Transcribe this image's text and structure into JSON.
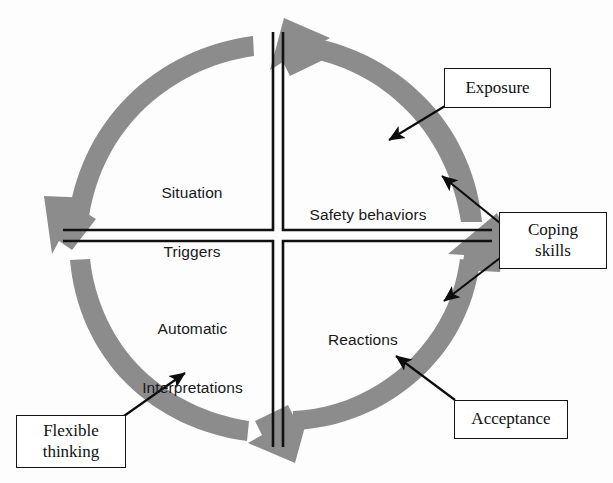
{
  "diagram": {
    "colors": {
      "ring_gray": "#8c8c8c",
      "line_black": "#111111",
      "box_border": "#141414",
      "box_fill": "#ffffff",
      "text_dark": "#18181a",
      "background": "#fdfdfd"
    },
    "quadrants": [
      {
        "id": "situation-triggers",
        "position": "top-left",
        "label_line1": "Situation",
        "label_line2": "Triggers"
      },
      {
        "id": "safety-behaviors",
        "position": "top-right",
        "label_line1": "Safety behaviors",
        "label_line2": ""
      },
      {
        "id": "automatic-interpretations",
        "position": "bottom-left",
        "label_line1": "Automatic",
        "label_line2": "Interpretations"
      },
      {
        "id": "reactions",
        "position": "bottom-right",
        "label_line1": "Reactions",
        "label_line2": ""
      }
    ],
    "callouts": [
      {
        "id": "exposure",
        "line1": "Exposure",
        "line2": "",
        "points_to": "safety-behaviors-arc"
      },
      {
        "id": "coping-skills",
        "line1": "Coping",
        "line2": "skills",
        "points_to": "safety-behaviors-label-and-reactions"
      },
      {
        "id": "acceptance",
        "line1": "Acceptance",
        "line2": "",
        "points_to": "reactions-arc"
      },
      {
        "id": "flexible-thinking",
        "line1": "Flexible",
        "line2": "thinking",
        "points_to": "automatic-interpretations-arc"
      }
    ],
    "flow": {
      "direction": "clockwise-through-quadrants",
      "arrowheads": [
        "top-pointing-left",
        "left-pointing-down",
        "bottom-pointing-right",
        "right-pointing-up"
      ]
    }
  }
}
